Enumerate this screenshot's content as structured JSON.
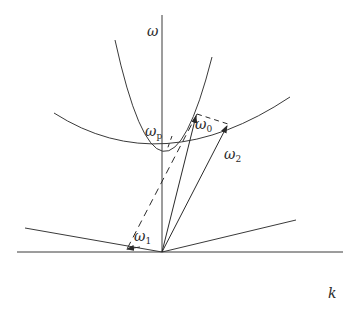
{
  "diagram": {
    "type": "dispersion-diagram",
    "colors": {
      "line": "#3a3a3a",
      "background": "#ffffff"
    },
    "axes": {
      "vertical_label": "ω",
      "horizontal_label": "k"
    },
    "curves": [
      {
        "name": "photon-dispersion-parabola",
        "style": "solid"
      },
      {
        "name": "plasma-dispersion-curve",
        "style": "solid"
      },
      {
        "name": "light-line-left",
        "style": "solid"
      },
      {
        "name": "light-line-right",
        "style": "solid"
      }
    ],
    "vectors": [
      {
        "name": "omega-0",
        "label_base": "ω",
        "label_sub": "0",
        "style": "solid"
      },
      {
        "name": "omega-2",
        "label_base": "ω",
        "label_sub": "2",
        "style": "solid"
      },
      {
        "name": "omega-1",
        "label_base": "ω",
        "label_sub": "1",
        "style": "dashed"
      }
    ],
    "labels": {
      "omega_p_base": "ω",
      "omega_p_sub": "p",
      "omega_0_base": "ω",
      "omega_0_sub": "0",
      "omega_1_base": "ω",
      "omega_1_sub": "1",
      "omega_2_base": "ω",
      "omega_2_sub": "2"
    }
  }
}
